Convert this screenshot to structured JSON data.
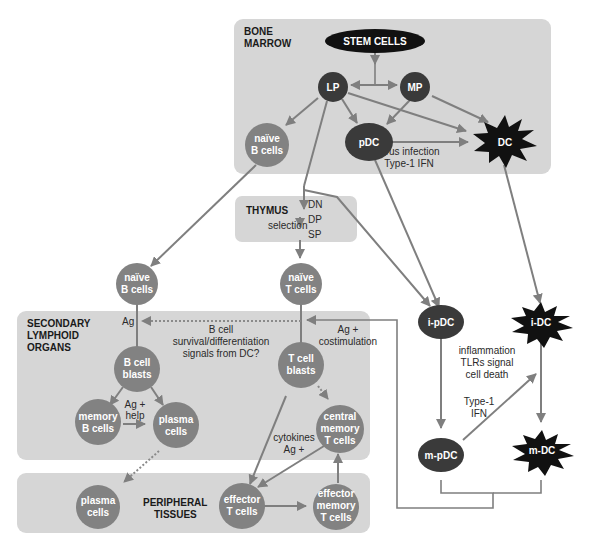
{
  "regions": {
    "bone_marrow": "BONE MARROW",
    "bone_marrow_l1": "BONE",
    "bone_marrow_l2": "MARROW",
    "thymus": "THYMUS",
    "secondary_l1": "SECONDARY",
    "secondary_l2": "LYMPHOID",
    "secondary_l3": "ORGANS",
    "peripheral_l1": "PERIPHERAL",
    "peripheral_l2": "TISSUES"
  },
  "nodes": {
    "stem_cells": "STEM CELLS",
    "lp": "LP",
    "mp": "MP",
    "pdc": "pDC",
    "dc": "DC",
    "naive_b_bm_l1": "naïve",
    "naive_b_bm_l2": "B cells",
    "naive_b_l1": "naïve",
    "naive_b_l2": "B cells",
    "naive_t_l1": "naïve",
    "naive_t_l2": "T cells",
    "ipdc": "i-pDC",
    "idc": "i-DC",
    "mpdc": "m-pDC",
    "mdc": "m-DC",
    "b_blasts_l1": "B cell",
    "b_blasts_l2": "blasts",
    "t_blasts_l1": "T cell",
    "t_blasts_l2": "blasts",
    "memory_b_l1": "memory",
    "memory_b_l2": "B cells",
    "plasma_so_l1": "plasma",
    "plasma_so_l2": "cells",
    "central_mem_l1": "central",
    "central_mem_l2": "memory",
    "central_mem_l3": "T cells",
    "plasma_pt_l1": "plasma",
    "plasma_pt_l2": "cells",
    "effector_t_l1": "effector",
    "effector_t_l2": "T cells",
    "effector_mem_l1": "effector",
    "effector_mem_l2": "memory",
    "effector_mem_l3": "T cells"
  },
  "thymus_stages": [
    "DN",
    "DP",
    "SP"
  ],
  "annotations": {
    "selection": "selection",
    "virus_l1": "virus infection",
    "virus_l2": "Type-1 IFN",
    "ag": "Ag",
    "bcell_signal_l1": "B cell",
    "bcell_signal_l2": "survival/differentiation",
    "bcell_signal_l3": "signals from DC?",
    "costim_l1": "Ag +",
    "costim_l2": "costimulation",
    "ag_help_l1": "Ag +",
    "ag_help_l2": "help",
    "cytokines_l1": "cytokines",
    "cytokines_l2": "Ag +",
    "inflam_l1": "inflammation",
    "inflam_l2": "TLRs signal",
    "inflam_l3": "cell death",
    "type1_l1": "Type-1",
    "type1_l2": "IFN"
  },
  "colors": {
    "region_fill": "#d6d6d6",
    "node_grey": "#828282",
    "node_dark": "#3a3a3a",
    "node_black": "#111111",
    "arrow": "#7f7f7f"
  }
}
